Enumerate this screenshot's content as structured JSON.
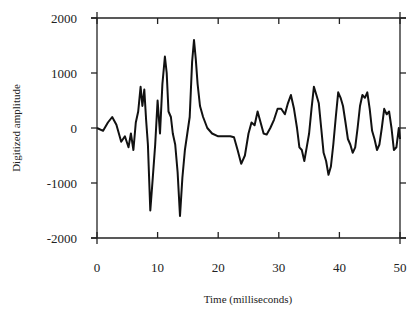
{
  "chart_data": {
    "type": "line",
    "title": "",
    "xlabel": "Time (milliseconds)",
    "ylabel": "Digitized amplitude",
    "xlim": [
      0,
      50
    ],
    "ylim": [
      -2000,
      2000
    ],
    "xticks": [
      0,
      10,
      20,
      30,
      40,
      50
    ],
    "yticks": [
      2000,
      1000,
      0,
      -1000,
      -2000
    ],
    "grid": false,
    "legend": null,
    "series": [
      {
        "name": "waveform",
        "color": "#111111",
        "x": [
          0,
          1,
          1.8,
          2.5,
          3.2,
          4,
          4.6,
          5.2,
          5.6,
          6,
          6.4,
          6.8,
          7.2,
          7.5,
          7.8,
          8.1,
          8.4,
          8.8,
          9.2,
          9.6,
          10.0,
          10.4,
          10.8,
          11.2,
          11.5,
          11.8,
          12.2,
          12.5,
          12.9,
          13.3,
          13.7,
          14.1,
          14.5,
          14.9,
          15.3,
          15.7,
          16.0,
          16.3,
          16.6,
          17.0,
          17.5,
          18.2,
          19.0,
          20.0,
          21.0,
          22.0,
          22.6,
          23.2,
          23.8,
          24.4,
          25.0,
          25.5,
          26.0,
          26.5,
          27.0,
          27.5,
          28.0,
          28.6,
          29.2,
          29.8,
          30.4,
          31.0,
          31.5,
          32.0,
          32.5,
          33.0,
          33.4,
          33.8,
          34.2,
          34.6,
          35.0,
          35.4,
          35.8,
          36.2,
          36.6,
          37.0,
          37.4,
          37.8,
          38.2,
          38.6,
          39.0,
          39.4,
          39.8,
          40.2,
          40.6,
          41.0,
          41.4,
          41.8,
          42.2,
          42.6,
          43.0,
          43.4,
          43.8,
          44.2,
          44.6,
          45.0,
          45.4,
          45.8,
          46.2,
          46.6,
          47.0,
          47.4,
          47.8,
          48.2,
          48.6,
          49.0,
          49.4,
          49.8,
          50
        ],
        "y": [
          0,
          -50,
          100,
          200,
          60,
          -250,
          -150,
          -350,
          -100,
          -400,
          100,
          300,
          750,
          400,
          700,
          150,
          -300,
          -1500,
          -900,
          -300,
          500,
          -100,
          800,
          1300,
          1000,
          300,
          200,
          -100,
          -300,
          -800,
          -1600,
          -900,
          -400,
          -100,
          200,
          1200,
          1600,
          1250,
          800,
          400,
          200,
          0,
          -100,
          -150,
          -150,
          -150,
          -170,
          -400,
          -650,
          -500,
          -100,
          100,
          50,
          300,
          100,
          -100,
          -120,
          0,
          150,
          350,
          350,
          250,
          450,
          600,
          350,
          0,
          -350,
          -400,
          -600,
          -350,
          -100,
          350,
          750,
          600,
          450,
          0,
          -450,
          -600,
          -850,
          -700,
          -300,
          200,
          650,
          550,
          400,
          100,
          -200,
          -300,
          -450,
          -350,
          0,
          400,
          600,
          550,
          650,
          350,
          -50,
          -200,
          -400,
          -300,
          0,
          350,
          250,
          300,
          0,
          -400,
          -350,
          0,
          -200
        ]
      }
    ]
  }
}
